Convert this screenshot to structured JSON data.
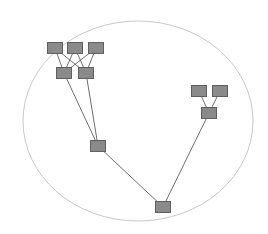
{
  "diagram": {
    "type": "tree",
    "boundary": {
      "shape": "ellipse",
      "color": "#c8c8c8"
    },
    "node_color": "#8a8a8a",
    "edge_color": "#6e6e6e",
    "nodes": [
      {
        "id": "t1",
        "label": ""
      },
      {
        "id": "t2",
        "label": ""
      },
      {
        "id": "t3",
        "label": ""
      },
      {
        "id": "m1",
        "label": ""
      },
      {
        "id": "m2",
        "label": ""
      },
      {
        "id": "c1",
        "label": ""
      },
      {
        "id": "root",
        "label": ""
      },
      {
        "id": "r1",
        "label": ""
      },
      {
        "id": "r2",
        "label": ""
      },
      {
        "id": "r3",
        "label": ""
      }
    ],
    "edges": [
      [
        "t1",
        "m1"
      ],
      [
        "t1",
        "m2"
      ],
      [
        "t2",
        "m1"
      ],
      [
        "t2",
        "m2"
      ],
      [
        "t3",
        "m1"
      ],
      [
        "t3",
        "m2"
      ],
      [
        "m1",
        "c1"
      ],
      [
        "m2",
        "c1"
      ],
      [
        "c1",
        "root"
      ],
      [
        "r1",
        "r3"
      ],
      [
        "r2",
        "r3"
      ],
      [
        "r3",
        "root"
      ]
    ]
  }
}
